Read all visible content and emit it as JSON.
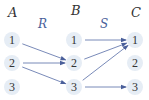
{
  "diagram": {
    "sets": [
      {
        "id": "A",
        "label": "A",
        "elements": [
          "1",
          "2",
          "3"
        ]
      },
      {
        "id": "B",
        "label": "B",
        "elements": [
          "1",
          "2",
          "3"
        ]
      },
      {
        "id": "C",
        "label": "C",
        "elements": [
          "1",
          "2",
          "3"
        ]
      }
    ],
    "relations": [
      {
        "label": "R",
        "from": "A",
        "to": "B",
        "pairs": [
          [
            "1",
            "2"
          ],
          [
            "2",
            "2"
          ],
          [
            "2",
            "3"
          ]
        ]
      },
      {
        "label": "S",
        "from": "B",
        "to": "C",
        "pairs": [
          [
            "1",
            "1"
          ],
          [
            "2",
            "1"
          ],
          [
            "3",
            "1"
          ],
          [
            "3",
            "3"
          ]
        ]
      }
    ],
    "colors": {
      "arrow": "#6a7db0",
      "node_fill": "#e6edf5",
      "relation_label": "#4a5f9a",
      "text": "#333333"
    }
  }
}
